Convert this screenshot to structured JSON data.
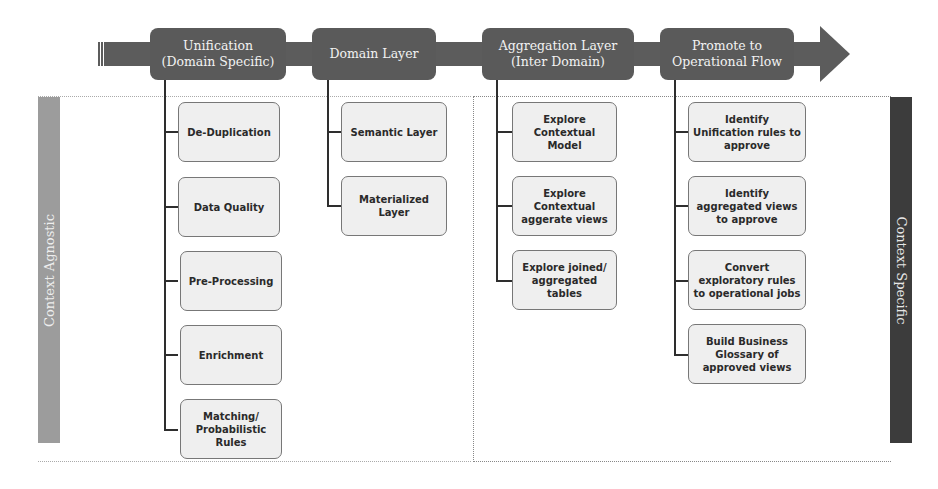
{
  "flow": {
    "stages": [
      {
        "line1": "Unification",
        "line2": "(Domain Specific)"
      },
      {
        "line1": "Domain Layer",
        "line2": ""
      },
      {
        "line1": "Aggregation Layer",
        "line2": "(Inter Domain)"
      },
      {
        "line1": "Promote to",
        "line2": "Operational Flow"
      }
    ]
  },
  "bands": {
    "left": "Context Agnostic",
    "right": "Context Specific"
  },
  "columns": {
    "unification": [
      "De-Duplication",
      "Data Quality",
      "Pre-Processing",
      "Enrichment",
      "Matching/ Probabilistic Rules"
    ],
    "domain": [
      "Semantic Layer",
      "Materialized Layer"
    ],
    "aggregation": [
      "Explore Contextual Model",
      "Explore Contextual aggerate views",
      "Explore joined/ aggregated tables"
    ],
    "promote": [
      "Identify Unification rules to approve",
      "Identify aggregated views to approve",
      "Convert exploratory rules to operational jobs",
      "Build Business Glossary of approved views"
    ]
  },
  "colors": {
    "stage_fill": "#5a5a5a",
    "box_fill": "#efefef",
    "band_left": "#9c9c9c",
    "band_right": "#3c3c3c"
  }
}
